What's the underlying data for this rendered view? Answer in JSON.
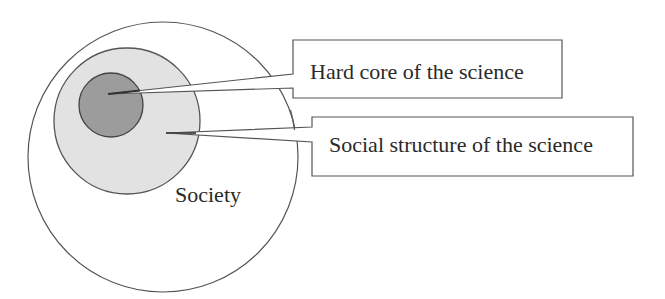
{
  "diagram": {
    "title": "",
    "labels": {
      "outer": "Society",
      "core_callout": "Hard core of the science",
      "social_callout": "Social structure of the science"
    },
    "circles": [
      {
        "name": "society",
        "cx": 163,
        "cy": 157,
        "r": 135,
        "fill": "#ffffff",
        "stroke": "#555555"
      },
      {
        "name": "social-structure",
        "cx": 127,
        "cy": 121,
        "r": 73,
        "fill": "#e2e2e2",
        "stroke": "#555555"
      },
      {
        "name": "hard-core",
        "cx": 111,
        "cy": 105,
        "r": 32,
        "fill": "#9c9c9c",
        "stroke": "#444444"
      }
    ],
    "colors": {
      "background": "#ffffff",
      "line": "#555555",
      "text": "#2a2a2a"
    }
  }
}
